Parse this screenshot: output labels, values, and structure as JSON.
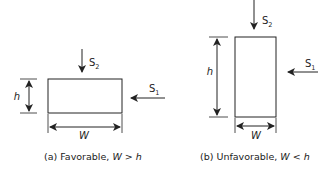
{
  "panels": [
    {
      "id": "a",
      "caption_prefix": "(a) Favorable, ",
      "caption_expr": "W > h",
      "labels": {
        "height": "h",
        "width": "W",
        "stress_vertical": "S",
        "stress_vertical_sub": "2",
        "stress_horizontal": "S",
        "stress_horizontal_sub": "1"
      },
      "orientation": "wide"
    },
    {
      "id": "b",
      "caption_prefix": "(b) Unfavorable, ",
      "caption_expr": "W < h",
      "labels": {
        "height": "h",
        "width": "W",
        "stress_vertical": "S",
        "stress_vertical_sub": "2",
        "stress_horizontal": "S",
        "stress_horizontal_sub": "1"
      },
      "orientation": "tall"
    }
  ],
  "colors": {
    "stroke": "#222222",
    "background": "#ffffff"
  }
}
